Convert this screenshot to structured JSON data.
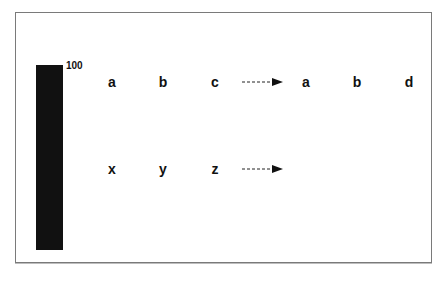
{
  "diagram": {
    "bar": {
      "label": "100",
      "color": "#111111"
    },
    "rows": [
      {
        "input": [
          "a",
          "b",
          "c"
        ],
        "arrow": "dashed-arrow",
        "output": [
          "a",
          "b",
          "d"
        ]
      },
      {
        "input": [
          "x",
          "y",
          "z"
        ],
        "arrow": "dashed-arrow",
        "output": []
      }
    ]
  }
}
